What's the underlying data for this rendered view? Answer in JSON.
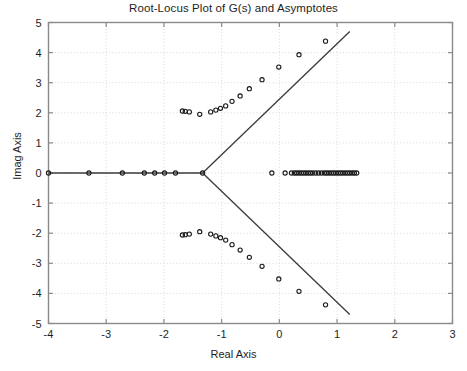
{
  "figure": {
    "title": "Root-Locus Plot of G(s) and Asymptotes",
    "background_color": "#ffffff",
    "frame_color": "#8a8a8a",
    "grid_color": "#d8d8d8",
    "marker_color": "#1a1a1a",
    "line_color": "#3a3a3a"
  },
  "chart_data": {
    "type": "scatter",
    "title": "Root-Locus Plot of G(s) and Asymptotes",
    "xlabel": "Real Axis",
    "ylabel": "Imag Axis",
    "xlim": [
      -4,
      3
    ],
    "ylim": [
      -5,
      5
    ],
    "xticks": [
      -4,
      -3,
      -2,
      -1,
      0,
      1,
      2,
      3
    ],
    "xtick_labels": [
      "-4",
      "-3",
      "-2",
      "-1",
      "0",
      "1",
      "2",
      "3"
    ],
    "yticks": [
      -5,
      -4,
      -3,
      -2,
      -1,
      0,
      1,
      2,
      3,
      4,
      5
    ],
    "ytick_labels": [
      "-5",
      "-4",
      "-3",
      "-2",
      "-1",
      "0",
      "1",
      "2",
      "3",
      "4",
      "5"
    ],
    "grid": true,
    "legend": null,
    "marker": "o",
    "series": [
      {
        "name": "root-locus-real-axis-left",
        "marker": "o",
        "points": [
          [
            -4.0,
            0.0
          ],
          [
            -3.3,
            0.0
          ],
          [
            -2.72,
            0.0
          ],
          [
            -2.34,
            0.0
          ],
          [
            -2.16,
            0.0
          ],
          [
            -1.99,
            0.0
          ],
          [
            -1.8,
            0.0
          ],
          [
            -1.33,
            0.0
          ]
        ]
      },
      {
        "name": "root-locus-upper-branch",
        "marker": "o",
        "points": [
          [
            -1.68,
            2.06
          ],
          [
            -1.63,
            2.05
          ],
          [
            -1.56,
            2.03
          ],
          [
            -1.38,
            1.95
          ],
          [
            -1.19,
            2.03
          ],
          [
            -1.1,
            2.09
          ],
          [
            -1.02,
            2.15
          ],
          [
            -0.93,
            2.23
          ],
          [
            -0.82,
            2.38
          ],
          [
            -0.68,
            2.56
          ],
          [
            -0.52,
            2.8
          ],
          [
            -0.3,
            3.1
          ],
          [
            -0.01,
            3.52
          ],
          [
            0.34,
            3.93
          ],
          [
            0.8,
            4.38
          ]
        ]
      },
      {
        "name": "root-locus-lower-branch",
        "marker": "o",
        "points": [
          [
            -1.68,
            -2.06
          ],
          [
            -1.63,
            -2.05
          ],
          [
            -1.56,
            -2.03
          ],
          [
            -1.38,
            -1.95
          ],
          [
            -1.19,
            -2.03
          ],
          [
            -1.1,
            -2.09
          ],
          [
            -1.02,
            -2.15
          ],
          [
            -0.93,
            -2.23
          ],
          [
            -0.82,
            -2.38
          ],
          [
            -0.68,
            -2.56
          ],
          [
            -0.52,
            -2.8
          ],
          [
            -0.3,
            -3.1
          ],
          [
            -0.01,
            -3.52
          ],
          [
            0.34,
            -3.93
          ],
          [
            0.8,
            -4.38
          ]
        ]
      },
      {
        "name": "root-locus-real-axis-right-cluster",
        "marker": "o",
        "points": [
          [
            -0.13,
            0.0
          ],
          [
            0.1,
            0.0
          ],
          [
            0.21,
            0.0
          ],
          [
            0.26,
            0.0
          ],
          [
            0.3,
            0.0
          ],
          [
            0.34,
            0.0
          ],
          [
            0.38,
            0.0
          ],
          [
            0.42,
            0.0
          ],
          [
            0.46,
            0.0
          ],
          [
            0.5,
            0.0
          ],
          [
            0.54,
            0.0
          ],
          [
            0.58,
            0.0
          ],
          [
            0.63,
            0.0
          ],
          [
            0.68,
            0.0
          ],
          [
            0.73,
            0.0
          ],
          [
            0.78,
            0.0
          ],
          [
            0.82,
            0.0
          ],
          [
            0.86,
            0.0
          ],
          [
            0.9,
            0.0
          ],
          [
            0.94,
            0.0
          ],
          [
            0.98,
            0.0
          ],
          [
            1.02,
            0.0
          ],
          [
            1.06,
            0.0
          ],
          [
            1.1,
            0.0
          ],
          [
            1.14,
            0.0
          ],
          [
            1.18,
            0.0
          ],
          [
            1.22,
            0.0
          ],
          [
            1.26,
            0.0
          ],
          [
            1.3,
            0.0
          ],
          [
            1.34,
            0.0
          ]
        ]
      }
    ],
    "lines": [
      {
        "name": "real-axis-locus-segment",
        "points": [
          [
            -4.0,
            0.0
          ],
          [
            -1.33,
            0.0
          ]
        ]
      },
      {
        "name": "asymptote-upper",
        "points": [
          [
            -1.33,
            0.0
          ],
          [
            1.22,
            4.7
          ]
        ]
      },
      {
        "name": "asymptote-lower",
        "points": [
          [
            -1.33,
            0.0
          ],
          [
            1.22,
            -4.7
          ]
        ]
      }
    ],
    "annotations": [
      {
        "name": "asymptote-centroid",
        "x": -1.33,
        "y": 0.0
      }
    ]
  }
}
